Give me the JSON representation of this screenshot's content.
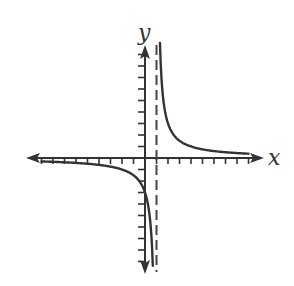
{
  "chart_data": {
    "type": "line",
    "title": "",
    "xlabel": "x",
    "ylabel": "y",
    "xlim": [
      -10,
      10
    ],
    "ylim": [
      -10,
      10
    ],
    "grid": false,
    "tick_marks_x": [
      -9,
      -8,
      -7,
      -6,
      -5,
      -4,
      -3,
      -2,
      -1,
      1,
      2,
      3,
      4,
      5,
      6,
      7,
      8,
      9
    ],
    "tick_marks_y": [
      -9,
      -8,
      -7,
      -6,
      -5,
      -4,
      -3,
      -2,
      -1,
      1,
      2,
      3,
      4,
      5,
      6,
      7,
      8,
      9
    ],
    "tick_labels": false,
    "asymptotes": {
      "vertical": [
        1
      ],
      "horizontal": [
        0
      ]
    },
    "series": [
      {
        "name": "right-branch",
        "description": "y = 3/(x-1), x > 1",
        "x": [
          1.3,
          1.5,
          2,
          2.5,
          3,
          4,
          5,
          6,
          7,
          8,
          9
        ],
        "y": [
          10,
          6,
          3,
          2,
          1.5,
          1,
          0.75,
          0.6,
          0.5,
          0.43,
          0.38
        ]
      },
      {
        "name": "left-branch",
        "description": "y = 3/(x-1), x < 1",
        "x": [
          -9,
          -7,
          -5,
          -3,
          -2,
          -1,
          -0.5,
          0,
          0.3,
          0.5,
          0.6,
          0.68
        ],
        "y": [
          -0.3,
          -0.38,
          -0.5,
          -0.75,
          -1,
          -1.5,
          -2,
          -3,
          -4.3,
          -6,
          -7.5,
          -9.4
        ]
      }
    ],
    "colors": {
      "curve": "#333333",
      "axes": "#333333",
      "asymptote": "#444444",
      "background": "#ffffff"
    }
  },
  "labels": {
    "x_axis": "x",
    "y_axis": "y"
  }
}
